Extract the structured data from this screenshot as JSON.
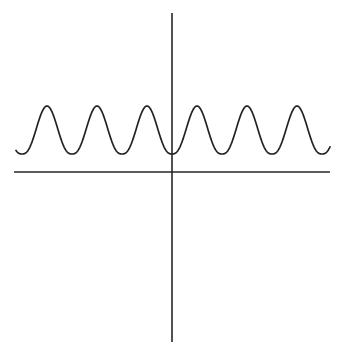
{
  "figure": {
    "title": "",
    "background_color": "#ffffff",
    "width": 344,
    "height": 355,
    "has_labels": false,
    "has_tick_marks": false,
    "has_gridlines": false,
    "has_legend": false
  },
  "axes": {
    "x_axis": {
      "name": "horizontal-axis",
      "y_pixel": 172,
      "x_start_pixel": 14,
      "x_end_pixel": 330,
      "color": "#262626",
      "stroke_width": 1.6,
      "label": ""
    },
    "y_axis": {
      "name": "vertical-axis",
      "x_pixel": 172,
      "y_start_pixel": 13,
      "y_end_pixel": 342,
      "color": "#262626",
      "stroke_width": 1.6,
      "label": ""
    },
    "origin_pixel": {
      "x": 172,
      "y": 172
    }
  },
  "chart_data": {
    "type": "line",
    "title": "",
    "subtitle": "",
    "xlabel": "",
    "ylabel": "",
    "grid": false,
    "legend": null,
    "curve_color": "#232323",
    "curve_stroke_width": 1.7,
    "period_pixels": 50,
    "peak_y_pixel": 106,
    "trough_y_pixel": 154,
    "baseline_y_pixel": 172,
    "amplitude_pixels": 48,
    "x_domain_pixels": [
      16,
      330
    ],
    "peaks_x_pixels": [
      47,
      97,
      147,
      197,
      247,
      297
    ],
    "troughs_x_pixels": [
      22,
      72,
      122,
      172,
      222,
      272,
      322
    ],
    "peak_count": 6,
    "trough_count": 7,
    "x": [
      16,
      22,
      28,
      34,
      40,
      47,
      54,
      60,
      66,
      72,
      78,
      84,
      90,
      97,
      104,
      110,
      116,
      122,
      128,
      134,
      140,
      147,
      154,
      160,
      166,
      172,
      178,
      184,
      190,
      197,
      204,
      210,
      216,
      222,
      228,
      234,
      240,
      247,
      254,
      260,
      266,
      272,
      278,
      284,
      290,
      297,
      304,
      310,
      316,
      322,
      328,
      330
    ],
    "y": [
      150,
      154,
      152,
      140,
      120,
      106,
      120,
      140,
      152,
      154,
      152,
      140,
      120,
      106,
      120,
      140,
      152,
      154,
      152,
      140,
      120,
      106,
      120,
      140,
      152,
      154,
      152,
      140,
      120,
      106,
      120,
      140,
      152,
      154,
      152,
      140,
      120,
      106,
      120,
      140,
      152,
      154,
      152,
      140,
      120,
      106,
      120,
      140,
      152,
      154,
      152,
      150
    ],
    "values_normalized": [
      0.08,
      0.0,
      0.04,
      0.29,
      0.71,
      1.0,
      0.71,
      0.29,
      0.04,
      0.0,
      0.04,
      0.29,
      0.71,
      1.0,
      0.71,
      0.29,
      0.04,
      0.0,
      0.04,
      0.29,
      0.71,
      1.0,
      0.71,
      0.29,
      0.04,
      0.0,
      0.04,
      0.29,
      0.71,
      1.0,
      0.71,
      0.29,
      0.04,
      0.0,
      0.04,
      0.29,
      0.71,
      1.0,
      0.71,
      0.29,
      0.04,
      0.0,
      0.04,
      0.29,
      0.71,
      1.0,
      0.71,
      0.29,
      0.04,
      0.0,
      0.04,
      0.08
    ]
  }
}
